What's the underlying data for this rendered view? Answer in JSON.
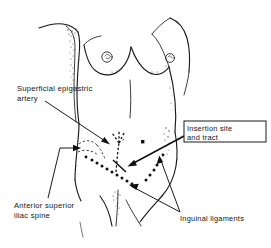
{
  "figure": {
    "type": "anatomical-line-drawing",
    "background_color": "#ffffff",
    "ink_color": "#1a1a1a",
    "width": 271,
    "height": 248
  },
  "labels": {
    "superficial_epigastric_artery": {
      "name": "superficial-epigastric-artery",
      "line1": "Superficial  epigastric",
      "line2": "artery"
    },
    "anterior_superior_iliac_spine": {
      "name": "anterior-superior-iliac-spine",
      "line1": "Anterior  superior",
      "line2": "iliac  spine"
    },
    "inguinal_ligaments": {
      "name": "inguinal-ligaments",
      "line1": "Inguinal ligaments"
    },
    "insertion_site": {
      "name": "insertion-site-and-tract",
      "line1": "Insertion  site",
      "line2": "and  tract",
      "boxed": true
    }
  },
  "markers": {
    "umbilicus": "solid-square-dot",
    "epigastric_artery_path": "dashed-line",
    "inguinal_ligament_left": "dotted-line",
    "inguinal_ligament_right": "dotted-line",
    "insertion_tract": "short-solid-stroke"
  },
  "colors": {
    "ink": "#1a1a1a",
    "dot": "#111111",
    "shading": "#3d3d3d",
    "paper": "#ffffff"
  }
}
